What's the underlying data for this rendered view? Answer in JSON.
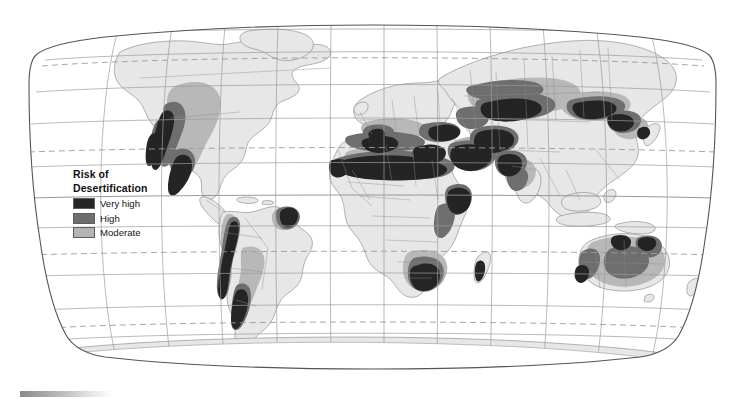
{
  "figure": {
    "name": "world-desertification-risk-map",
    "projection": "robinson",
    "ocean_color": "#ffffff",
    "land_color": "#e6e6e6",
    "graticule_color": "#9a9a9a",
    "tropic_line_color": "#9a9a9a",
    "outline_color": "#555555",
    "coastline_color": "#7d7d7d",
    "border_color": "#8f8f8f"
  },
  "legend": {
    "title_line1": "Risk of",
    "title_line2": "Desertification",
    "items": [
      {
        "label": "Very high",
        "color": "#262626"
      },
      {
        "label": "High",
        "color": "#6e6e6e"
      },
      {
        "label": "Moderate",
        "color": "#b4b4b4"
      }
    ]
  },
  "scale_bar": {
    "name": "gradient-bar",
    "from_color": "#8a8a8a",
    "to_color": "#ffffff"
  },
  "graticule": {
    "parallels": [
      {
        "label": "75N",
        "dashed": false
      },
      {
        "label": "60N",
        "dashed": false
      },
      {
        "label": "Arctic Circle",
        "dashed": true
      },
      {
        "label": "45N",
        "dashed": false
      },
      {
        "label": "30N",
        "dashed": false
      },
      {
        "label": "Tropic of Cancer",
        "dashed": true
      },
      {
        "label": "15N",
        "dashed": false
      },
      {
        "label": "Equator",
        "dashed": false
      },
      {
        "label": "15S",
        "dashed": false
      },
      {
        "label": "Tropic of Capricorn",
        "dashed": true
      },
      {
        "label": "30S",
        "dashed": false
      },
      {
        "label": "45S",
        "dashed": false
      },
      {
        "label": "60S",
        "dashed": false
      },
      {
        "label": "Antarctic Circle",
        "dashed": true
      }
    ],
    "meridians": [
      "150W",
      "120W",
      "90W",
      "60W",
      "30W",
      "0",
      "30E",
      "60E",
      "90E",
      "120E",
      "150E"
    ]
  },
  "risk_regions": [
    {
      "name": "us-southwest-mexico",
      "level": "Very high"
    },
    {
      "name": "us-great-plains",
      "level": "Moderate"
    },
    {
      "name": "mexico-baja",
      "level": "High"
    },
    {
      "name": "andes-patagonia",
      "level": "Very high"
    },
    {
      "name": "argentina-pampas",
      "level": "Moderate"
    },
    {
      "name": "northeast-brazil",
      "level": "Very high"
    },
    {
      "name": "sahel-band",
      "level": "Very high"
    },
    {
      "name": "sahara-margin",
      "level": "High"
    },
    {
      "name": "horn-of-africa",
      "level": "Very high"
    },
    {
      "name": "southern-africa-kalahari",
      "level": "High"
    },
    {
      "name": "iberia-mediterranean",
      "level": "High"
    },
    {
      "name": "middle-east-arabia",
      "level": "Very high"
    },
    {
      "name": "central-asia-kazakhstan",
      "level": "High"
    },
    {
      "name": "mongolia-gobi",
      "level": "High"
    },
    {
      "name": "northern-china",
      "level": "Very high"
    },
    {
      "name": "india-thar",
      "level": "High"
    },
    {
      "name": "australia-interior",
      "level": "Moderate"
    },
    {
      "name": "australia-margins",
      "level": "High"
    }
  ]
}
